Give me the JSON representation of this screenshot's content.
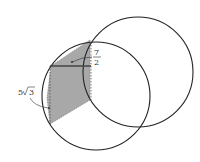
{
  "diagram": {
    "labels": {
      "seven": "7",
      "two": "2",
      "five_sqrt_three_coef": "5",
      "five_sqrt_three_rad": "3"
    },
    "colors": {
      "stroke": "#222222",
      "shade": "#a8a8a8",
      "background": "#ffffff"
    }
  }
}
